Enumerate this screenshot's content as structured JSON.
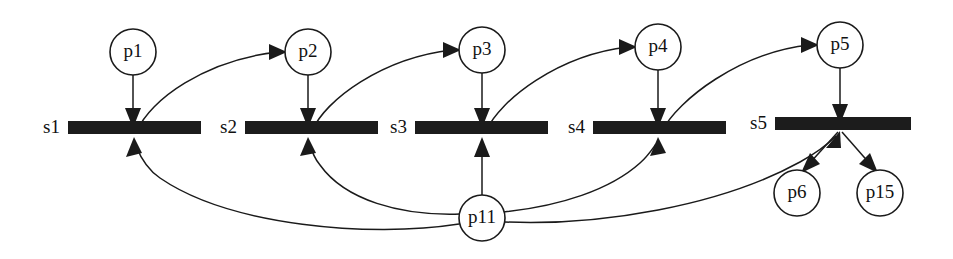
{
  "diagram": {
    "type": "petri-net",
    "canvas": {
      "width": 953,
      "height": 259
    },
    "colors": {
      "background": "#ffffff",
      "stroke": "#1a1a1a",
      "transition_fill": "#1c1c1c",
      "place_fill": "#ffffff",
      "text": "#111111"
    },
    "places": [
      {
        "id": "p1",
        "label": "p1",
        "cx": 133,
        "cy": 52,
        "r": 23
      },
      {
        "id": "p2",
        "label": "p2",
        "cx": 308,
        "cy": 52,
        "r": 23
      },
      {
        "id": "p3",
        "label": "p3",
        "cx": 482,
        "cy": 50,
        "r": 23
      },
      {
        "id": "p4",
        "label": "p4",
        "cx": 658,
        "cy": 47,
        "r": 23
      },
      {
        "id": "p5",
        "label": "p5",
        "cx": 840,
        "cy": 45,
        "r": 23
      },
      {
        "id": "p6",
        "label": "p6",
        "cx": 797,
        "cy": 193,
        "r": 23
      },
      {
        "id": "p15",
        "label": "p15",
        "cx": 880,
        "cy": 193,
        "r": 23
      },
      {
        "id": "p11",
        "label": "p11",
        "cx": 482,
        "cy": 218,
        "r": 23
      }
    ],
    "transitions": [
      {
        "id": "s1",
        "label": "s1",
        "x": 68,
        "y": 121,
        "width": 133,
        "height": 13,
        "cx": 134,
        "label_x": 60
      },
      {
        "id": "s2",
        "label": "s2",
        "x": 245,
        "y": 121,
        "width": 133,
        "height": 13,
        "cx": 308,
        "label_x": 237
      },
      {
        "id": "s3",
        "label": "s3",
        "x": 415,
        "y": 121,
        "width": 133,
        "height": 13,
        "cx": 482,
        "label_x": 407
      },
      {
        "id": "s4",
        "label": "s4",
        "x": 593,
        "y": 121,
        "width": 133,
        "height": 13,
        "cx": 658,
        "label_x": 585
      },
      {
        "id": "s5",
        "label": "s5",
        "x": 775,
        "y": 117,
        "width": 136,
        "height": 13,
        "cx": 840,
        "label_x": 767
      }
    ],
    "arcs": [
      {
        "id": "arc-p1-s1",
        "from": "p1",
        "to": "s1",
        "kind": "place-to-transition",
        "shape": "straight"
      },
      {
        "id": "arc-p2-s2",
        "from": "p2",
        "to": "s2",
        "kind": "place-to-transition",
        "shape": "straight"
      },
      {
        "id": "arc-p3-s3",
        "from": "p3",
        "to": "s3",
        "kind": "place-to-transition",
        "shape": "straight"
      },
      {
        "id": "arc-p4-s4",
        "from": "p4",
        "to": "s4",
        "kind": "place-to-transition",
        "shape": "straight"
      },
      {
        "id": "arc-p5-s5",
        "from": "p5",
        "to": "s5",
        "kind": "place-to-transition",
        "shape": "straight"
      },
      {
        "id": "arc-s1-p2",
        "from": "s1",
        "to": "p2",
        "kind": "transition-to-place",
        "shape": "curve"
      },
      {
        "id": "arc-s2-p3",
        "from": "s2",
        "to": "p3",
        "kind": "transition-to-place",
        "shape": "curve"
      },
      {
        "id": "arc-s3-p4",
        "from": "s3",
        "to": "p4",
        "kind": "transition-to-place",
        "shape": "curve"
      },
      {
        "id": "arc-s4-p5",
        "from": "s4",
        "to": "p5",
        "kind": "transition-to-place",
        "shape": "curve"
      },
      {
        "id": "arc-p11-s1",
        "from": "p11",
        "to": "s1",
        "kind": "place-to-transition",
        "shape": "curve"
      },
      {
        "id": "arc-p11-s2",
        "from": "p11",
        "to": "s2",
        "kind": "place-to-transition",
        "shape": "curve"
      },
      {
        "id": "arc-p11-s3",
        "from": "p11",
        "to": "s3",
        "kind": "place-to-transition",
        "shape": "straight"
      },
      {
        "id": "arc-p11-s4",
        "from": "p11",
        "to": "s4",
        "kind": "place-to-transition",
        "shape": "curve"
      },
      {
        "id": "arc-p11-s5",
        "from": "p11",
        "to": "s5",
        "kind": "place-to-transition",
        "shape": "curve"
      },
      {
        "id": "arc-s5-p6",
        "from": "s5",
        "to": "p6",
        "kind": "transition-to-place",
        "shape": "straight"
      },
      {
        "id": "arc-s5-p15",
        "from": "s5",
        "to": "p15",
        "kind": "transition-to-place",
        "shape": "straight"
      }
    ]
  }
}
